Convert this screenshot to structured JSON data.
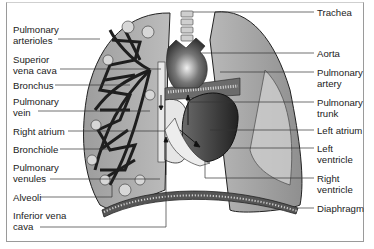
{
  "labels_left": [
    {
      "id": "pulmonary-arterioles",
      "text": "Pulmonary\narterioles",
      "y": 26
    },
    {
      "id": "superior-vena-cava",
      "text": "Superior\nvena cava",
      "y": 54
    },
    {
      "id": "bronchus",
      "text": "Bronchus",
      "y": 80
    },
    {
      "id": "pulmonary-vein",
      "text": "Pulmonary\nvein",
      "y": 96
    },
    {
      "id": "right-atrium",
      "text": "Right atrium",
      "y": 126
    },
    {
      "id": "bronchiole",
      "text": "Bronchiole",
      "y": 144
    },
    {
      "id": "pulmonary-venules",
      "text": "Pulmonary\nvenules",
      "y": 162
    },
    {
      "id": "alveoli",
      "text": "Alveoli",
      "y": 192
    },
    {
      "id": "inferior-vena-cava",
      "text": "Inferior vena\ncava",
      "y": 210
    }
  ],
  "labels_right": [
    {
      "id": "trachea",
      "text": "Trachea",
      "y": 7
    },
    {
      "id": "aorta",
      "text": "Aorta",
      "y": 48
    },
    {
      "id": "pulmonary-artery",
      "text": "Pulmonary\nartery",
      "y": 66
    },
    {
      "id": "pulmonary-trunk",
      "text": "Pulmonary\ntrunk",
      "y": 96
    },
    {
      "id": "left-atrium",
      "text": "Left atrium",
      "y": 124
    },
    {
      "id": "left-ventricle",
      "text": "Left\nventricle",
      "y": 142
    },
    {
      "id": "right-ventricle",
      "text": "Right\nventricle",
      "y": 172
    },
    {
      "id": "diaphragm",
      "text": "Diaphragm",
      "y": 202
    }
  ],
  "colors": {
    "lung": "#a9a9a9",
    "lung_light": "#c9c9c9",
    "heart_dark": "#3a3a3a",
    "vessel_light": "#e6e6e6",
    "leader": "#333333"
  }
}
